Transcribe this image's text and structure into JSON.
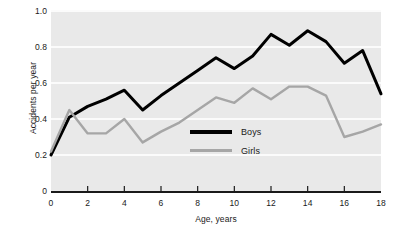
{
  "chart_data": {
    "type": "line",
    "title": "",
    "xlabel": "Age, years",
    "ylabel": "Accidents per year",
    "xlim": [
      0,
      18
    ],
    "ylim": [
      0,
      1.0
    ],
    "grid": true,
    "legend_position": "center",
    "x": [
      0,
      1,
      2,
      3,
      4,
      5,
      6,
      7,
      8,
      9,
      10,
      11,
      12,
      13,
      14,
      15,
      16,
      17,
      18
    ],
    "xticks": [
      0,
      2,
      4,
      6,
      8,
      10,
      12,
      14,
      16,
      18
    ],
    "xtick_labels": [
      "0",
      "2",
      "4",
      "6",
      "8",
      "10",
      "12",
      "14",
      "16",
      "18"
    ],
    "yticks": [
      0,
      0.2,
      0.4,
      0.6,
      0.8,
      1.0
    ],
    "ytick_labels": [
      "0",
      "0.2",
      "0.4",
      "0.6",
      "0.8",
      "1.0"
    ],
    "series": [
      {
        "name": "Boys",
        "color": "#000000",
        "width": 3.0,
        "values": [
          0.2,
          0.41,
          0.47,
          0.51,
          0.56,
          0.45,
          0.53,
          0.6,
          0.67,
          0.74,
          0.68,
          0.75,
          0.87,
          0.81,
          0.89,
          0.83,
          0.71,
          0.78,
          0.54
        ]
      },
      {
        "name": "Girls",
        "color": "#a6a6a6",
        "width": 2.4,
        "values": [
          0.22,
          0.45,
          0.32,
          0.32,
          0.4,
          0.27,
          0.33,
          0.38,
          0.45,
          0.52,
          0.49,
          0.57,
          0.51,
          0.58,
          0.58,
          0.53,
          0.3,
          0.33,
          0.37
        ]
      }
    ],
    "panel_background": "#e9e9e9",
    "gridline_color": "#fbfbfb",
    "axis_color": "#1a1a1a",
    "figure_background": "#ffffff"
  }
}
